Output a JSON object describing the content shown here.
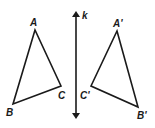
{
  "diagram": {
    "type": "reflection",
    "line": {
      "label": "k",
      "x": 76,
      "y1": 10,
      "y2": 120
    },
    "original_triangle": {
      "vertices": [
        {
          "label": "A",
          "x": 35,
          "y": 30,
          "lx": 30,
          "ly": 26
        },
        {
          "label": "B",
          "x": 13,
          "y": 104,
          "lx": 6,
          "ly": 116
        },
        {
          "label": "C",
          "x": 61,
          "y": 86,
          "lx": 58,
          "ly": 99
        }
      ]
    },
    "image_triangle": {
      "vertices": [
        {
          "label": "A'",
          "x": 117,
          "y": 31,
          "lx": 113,
          "ly": 27
        },
        {
          "label": "B'",
          "x": 138,
          "y": 107,
          "lx": 137,
          "ly": 119
        },
        {
          "label": "C'",
          "x": 91,
          "y": 86,
          "lx": 80,
          "ly": 99
        }
      ]
    },
    "colors": {
      "stroke": "#1a1a1a",
      "background": "#ffffff"
    }
  }
}
